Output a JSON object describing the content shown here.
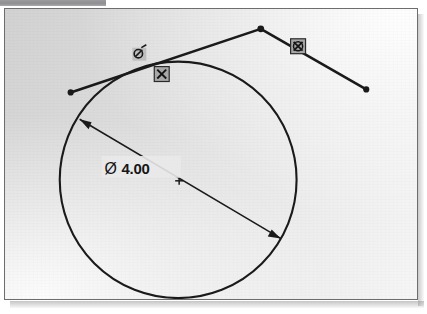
{
  "window": {
    "top_strip_label": "toolbar-strip",
    "frame_label": "sketch-canvas"
  },
  "sketch": {
    "title": "CAD sketch of circle tangent to polyline",
    "background_color": "#e2e2e2",
    "line_color": "#1a1a1a",
    "dimension": {
      "symbol": "Ø",
      "value": "4.00",
      "full_text": "Ø 4.00",
      "type": "diameter",
      "leader_from": "upper-left circle edge",
      "leader_to": "lower-right circle edge"
    },
    "entities": [
      {
        "name": "circle",
        "type": "circle",
        "center_x": 174,
        "center_y": 172,
        "radius": 119,
        "diameter_label": "Ø 4.00"
      },
      {
        "name": "polyline",
        "type": "polyline",
        "points": [
          {
            "x": 66,
            "y": 84
          },
          {
            "x": 257,
            "y": 20
          },
          {
            "x": 363,
            "y": 81
          }
        ],
        "endpoint_markers": "filled-dot"
      },
      {
        "name": "center-mark",
        "type": "point",
        "x": 175,
        "y": 173
      }
    ],
    "constraints": [
      {
        "name": "tangent-constraint-1",
        "glyph": "⊘",
        "icon_name": "tangent-constraint-icon",
        "x": 135,
        "y": 45,
        "boxed": false
      },
      {
        "name": "coincident-constraint",
        "glyph": "⊗",
        "icon_name": "coincident-constraint-icon",
        "x": 157,
        "y": 65,
        "boxed": true
      },
      {
        "name": "tangent-constraint-2",
        "glyph": "⊗",
        "icon_name": "tangent-constraint-icon",
        "x": 294,
        "y": 37,
        "boxed": true
      }
    ]
  }
}
